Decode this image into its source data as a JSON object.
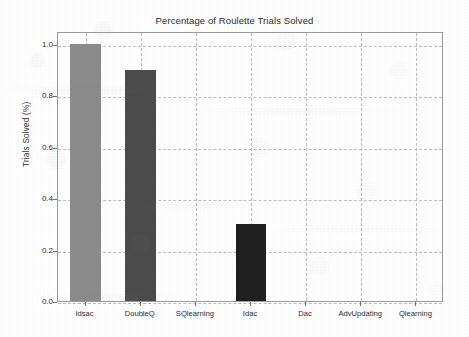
{
  "chart_data": {
    "type": "bar",
    "title": "Percentage of Roulette Trials Solved",
    "xlabel": "",
    "ylabel": "Trials Solved (%)",
    "categories": [
      "Idsac",
      "DoubleQ",
      "SQlearning",
      "Idac",
      "Dac",
      "AdvUpdating",
      "Qlearning"
    ],
    "values": [
      1.0,
      0.9,
      0.0,
      0.3,
      0.0,
      0.0,
      0.0
    ],
    "bar_colors": [
      "#8b8b8b",
      "#4b4b4b",
      "#8b8b8b",
      "#1f1f1f",
      "#8b8b8b",
      "#8b8b8b",
      "#8b8b8b"
    ],
    "ylim": [
      0.0,
      1.05
    ],
    "yticks": [
      0.0,
      0.2,
      0.4,
      0.6,
      0.8,
      1.0
    ],
    "ytick_labels": [
      "0.0",
      "0.2",
      "0.4",
      "0.6",
      "0.8",
      "1.0"
    ],
    "grid": true,
    "grid_color": "#bdbdbd",
    "legend": null,
    "legend_position": "none",
    "axis_color": "#9a9a9a",
    "text_color": "#2b2b2b",
    "background": "#ffffff"
  },
  "figure": {
    "title_text": "Percentage of Roulette Trials Solved",
    "y_axis_title": "Trials Solved (%)"
  }
}
